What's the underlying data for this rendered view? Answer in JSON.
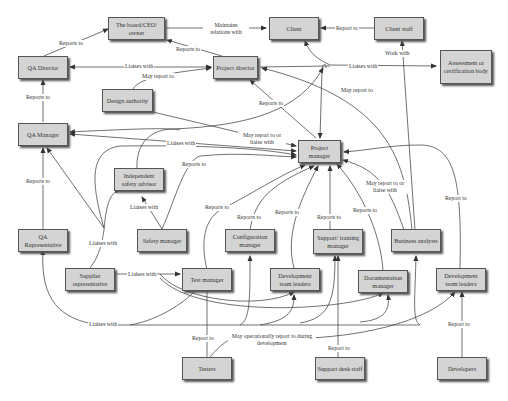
{
  "nodes": {
    "board": {
      "label": "The board/CEO/ owner"
    },
    "client": {
      "label": "Client"
    },
    "client_staff": {
      "label": "Client staff"
    },
    "qa_director": {
      "label": "QA Director"
    },
    "project_director": {
      "label": "Project director"
    },
    "assessment_body": {
      "label": "Assessment or certification body"
    },
    "design_authority": {
      "label": "Design authority"
    },
    "qa_manager": {
      "label": "QA Manager"
    },
    "project_manager": {
      "label": "Project manager"
    },
    "independent_safety_advisor": {
      "label": "Independent safety advisor"
    },
    "qa_representative": {
      "label": "QA Representative"
    },
    "safety_manager": {
      "label": "Safety manager"
    },
    "configuration_manager": {
      "label": "Configuration manager"
    },
    "support_training_manager": {
      "label": "Support/ training manager"
    },
    "business_analysts": {
      "label": "Business analysts"
    },
    "supplier_representative": {
      "label": "Supplier representative"
    },
    "test_manager": {
      "label": "Test manager"
    },
    "dev_team_leaders_1": {
      "label": "Development team leaders"
    },
    "documentation_manager": {
      "label": "Documentation manager"
    },
    "dev_team_leaders_2": {
      "label": "Development team leaders"
    },
    "testers": {
      "label": "Testers"
    },
    "support_desk_staff": {
      "label": "Support desk staff"
    },
    "developers": {
      "label": "Developers"
    }
  },
  "edge_labels": {
    "maintains_relations": "Maintains relations with",
    "client_staff_report": "Report to",
    "qa_dir_reports_board": "Reports to",
    "pd_reports_board": "Reports to",
    "qa_dir_liaises_pd": "Liaises with",
    "design_may_report": "May report to",
    "pd_liaises_assessment": "Liaises with",
    "work_with": "Work with",
    "ba_may_report_pd": "May report to",
    "qa_mgr_reports_dir": "Reports to",
    "pm_reports_pd": "Reports to",
    "design_may_report_pm": "May report to or liaise with",
    "qa_mgr_liaises": "Liaises with",
    "safety_reports": "Reports to",
    "qa_rep_reports": "Reports to",
    "safety_liaises_isa": "Liaises with",
    "test_reports": "Reports to",
    "config_reports": "Reports to",
    "devlead_reports": "Reports to",
    "support_reports": "Reports to",
    "doc_reports": "Reports to",
    "ba_may_report_pm": "May report to or liaise with",
    "dev2_report": "Report to",
    "supplier_liaises_many": "Liaises with",
    "supplier_liaises_test": "Liaises with",
    "qa_rep_liaises": "Liaises with",
    "testers_report": "Report to",
    "testers_may_report": "May operationally report to during development",
    "support_desk_report": "Report to",
    "developers_report": "Report to"
  },
  "colors": {
    "node_fill": "#d4d4d4",
    "node_border": "#555555",
    "edge": "#333333"
  }
}
